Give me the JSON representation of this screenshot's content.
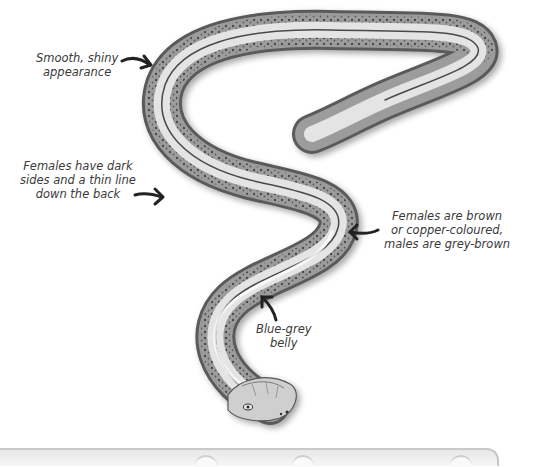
{
  "illustration": {
    "subject": "slow-worm",
    "palette": {
      "body_light": "#e6e6e6",
      "body_mid": "#9a9a9a",
      "body_dark": "#3c3c3c",
      "text": "#3a3a3a",
      "arrow": "#222222"
    }
  },
  "annotations": [
    {
      "id": "shiny",
      "lines": [
        "Smooth, shiny",
        "appearance"
      ]
    },
    {
      "id": "female-sides",
      "lines": [
        "Females have dark",
        "sides and a thin line",
        "down the back"
      ]
    },
    {
      "id": "colour",
      "lines": [
        "Females are brown",
        "or copper-coloured,",
        "males are grey-brown"
      ]
    },
    {
      "id": "belly",
      "lines": [
        "Blue-grey",
        "belly"
      ]
    }
  ]
}
